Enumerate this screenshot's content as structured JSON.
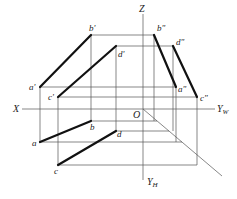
{
  "diagram": {
    "type": "orthographic-projection",
    "axes": {
      "z_label": "Z",
      "x_label": "X",
      "yw_label": "Y",
      "yw_sub": "W",
      "yh_label": "Y",
      "yh_sub": "H",
      "origin_label": "O"
    },
    "points": {
      "front_view": {
        "a": "a'",
        "b": "b'",
        "c": "c'",
        "d": "d'"
      },
      "side_view": {
        "a": "a\"",
        "b": "b\"",
        "c": "c\"",
        "d": "d\""
      },
      "top_view": {
        "a": "a",
        "b": "b",
        "c": "c",
        "d": "d"
      }
    },
    "segments": [
      {
        "name": "AB",
        "front": "a'b'",
        "side": "a\"b\"",
        "top": "ab"
      },
      {
        "name": "CD",
        "front": "c'd'",
        "side": "c\"d\"",
        "top": "cd"
      }
    ]
  }
}
